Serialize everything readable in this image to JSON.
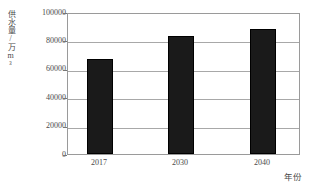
{
  "chart_data": {
    "type": "bar",
    "title": "",
    "categories": [
      "2017",
      "2030",
      "2040"
    ],
    "values": [
      68000,
      84000,
      89000
    ],
    "series": [
      {
        "name": "供水量",
        "values": [
          68000,
          84000,
          89000
        ]
      }
    ],
    "xlabel": "年份",
    "ylabel": "供水量/万m³",
    "ylim": [
      0,
      100000
    ],
    "yticks": [
      0,
      20000,
      40000,
      60000,
      80000,
      100000
    ],
    "ytick_labels": [
      "0",
      "20000",
      "40000",
      "60000",
      "80000",
      "100000"
    ],
    "grid": true,
    "legend": false,
    "bar_color": "#1a1a1a",
    "axis_color": "#9a9a9a",
    "gridline_color": "#a8a8a8",
    "background": "#ffffff"
  }
}
